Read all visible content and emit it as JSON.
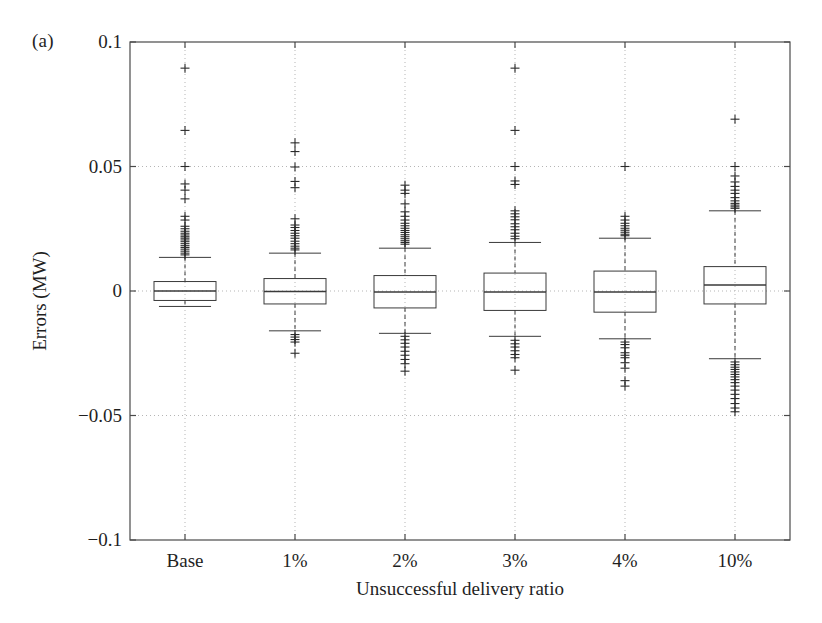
{
  "panel": {
    "label": "(a)"
  },
  "axes": {
    "xlabel": "Unsuccessful delivery ratio",
    "ylabel": "Errors (MW)",
    "ytick_labels": [
      "0.1",
      "0.05",
      "0",
      "−0.05",
      "−0.1"
    ],
    "xtick_labels": [
      "Base",
      "1%",
      "2%",
      "3%",
      "4%",
      "10%"
    ]
  },
  "style": {
    "axis_color": "#4a4a4a",
    "grid_color": "#b5b5b5",
    "box_color": "#3a3a3a",
    "outlier_color": "#2b2b2b",
    "background": "#ffffff"
  },
  "chart_data": {
    "type": "box",
    "title": "",
    "xlabel": "Unsuccessful delivery ratio",
    "ylabel": "Errors (MW)",
    "ylim": [
      -0.1,
      0.1
    ],
    "yticks": [
      0.1,
      0.05,
      0,
      -0.05,
      -0.1
    ],
    "grid": true,
    "legend": null,
    "categories": [
      "Base",
      "1%",
      "2%",
      "3%",
      "4%",
      "10%"
    ],
    "boxes": [
      {
        "category": "Base",
        "whisker_high": 0.0135,
        "q3": 0.0038,
        "median": 0.0,
        "q1": -0.0038,
        "whisker_low": -0.0062,
        "outliers_high": [
          0.0895,
          0.0645,
          0.05,
          0.043,
          0.0405,
          0.037,
          0.03,
          0.0285,
          0.026,
          0.025,
          0.024,
          0.0232,
          0.0225,
          0.0218,
          0.0212,
          0.0205,
          0.0198,
          0.019,
          0.0182,
          0.0175,
          0.0168,
          0.016,
          0.0152,
          0.0145
        ],
        "outliers_low": []
      },
      {
        "category": "1%",
        "whisker_high": 0.0152,
        "q3": 0.005,
        "median": -0.0002,
        "q1": -0.0052,
        "whisker_low": -0.016,
        "outliers_high": [
          0.0595,
          0.056,
          0.0498,
          0.044,
          0.0415,
          0.029,
          0.0265,
          0.0255,
          0.0243,
          0.0232,
          0.0222,
          0.0212,
          0.02,
          0.019,
          0.018,
          0.0172,
          0.0165
        ],
        "outliers_low": [
          -0.0175,
          -0.0185,
          -0.0195,
          -0.0205,
          -0.025
        ]
      },
      {
        "category": "2%",
        "whisker_high": 0.0172,
        "q3": 0.0062,
        "median": -0.0004,
        "q1": -0.0068,
        "whisker_low": -0.017,
        "outliers_high": [
          0.0425,
          0.0405,
          0.0392,
          0.035,
          0.0318,
          0.03,
          0.0285,
          0.0272,
          0.0262,
          0.0252,
          0.0243,
          0.0235,
          0.0226,
          0.0218,
          0.021,
          0.0202,
          0.0195,
          0.0188
        ],
        "outliers_low": [
          -0.0182,
          -0.0196,
          -0.021,
          -0.0225,
          -0.0242,
          -0.0258,
          -0.0275,
          -0.0292,
          -0.0322
        ]
      },
      {
        "category": "3%",
        "whisker_high": 0.0195,
        "q3": 0.0072,
        "median": -0.0004,
        "q1": -0.0078,
        "whisker_low": -0.0182,
        "outliers_high": [
          0.0895,
          0.0645,
          0.05,
          0.0442,
          0.0428,
          0.0322,
          0.031,
          0.0298,
          0.0286,
          0.027,
          0.0258,
          0.0246,
          0.0232,
          0.022,
          0.021
        ],
        "outliers_low": [
          -0.0198,
          -0.0212,
          -0.0225,
          -0.024,
          -0.0255,
          -0.0268,
          -0.0318
        ]
      },
      {
        "category": "4%",
        "whisker_high": 0.0212,
        "q3": 0.008,
        "median": -0.0004,
        "q1": -0.0085,
        "whisker_low": -0.0192,
        "outliers_high": [
          0.05,
          0.03,
          0.0285,
          0.0272,
          0.0262,
          0.0252,
          0.0244,
          0.0236,
          0.0228,
          0.0222
        ],
        "outliers_low": [
          -0.0205,
          -0.0215,
          -0.0228,
          -0.0248,
          -0.0258,
          -0.0268,
          -0.0288,
          -0.031,
          -0.036,
          -0.0382
        ]
      },
      {
        "category": "10%",
        "whisker_high": 0.0322,
        "q3": 0.0098,
        "median": 0.0024,
        "q1": -0.0052,
        "whisker_low": -0.0272,
        "outliers_high": [
          0.069,
          0.05,
          0.0462,
          0.0438,
          0.042,
          0.0405,
          0.0392,
          0.0375,
          0.0362,
          0.0352,
          0.0345,
          0.0338,
          0.0332
        ],
        "outliers_low": [
          -0.0285,
          -0.0296,
          -0.0306,
          -0.0315,
          -0.0325,
          -0.0335,
          -0.0345,
          -0.0356,
          -0.0368,
          -0.0382,
          -0.0398,
          -0.0415,
          -0.0432,
          -0.0452,
          -0.047,
          -0.0485
        ]
      }
    ]
  }
}
